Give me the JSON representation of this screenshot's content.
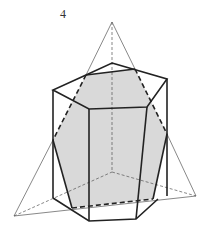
{
  "figure": {
    "label": "4",
    "colors": {
      "stroke": "#222222",
      "thin_stroke": "#555555",
      "fill": "#d9d9d9"
    }
  }
}
